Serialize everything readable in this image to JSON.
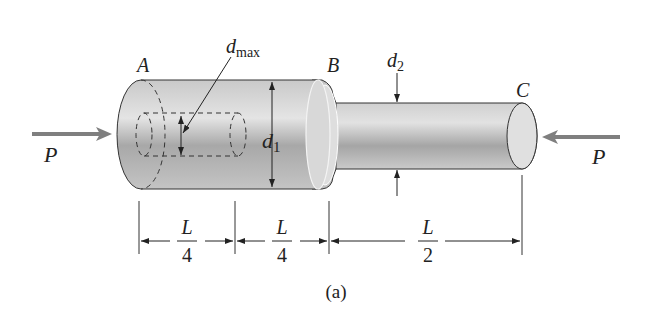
{
  "figure": {
    "caption": "(a)",
    "points": {
      "A": "A",
      "B": "B",
      "C": "C"
    },
    "load": {
      "left": "P",
      "right": "P"
    },
    "diameters": {
      "d1_main": "d",
      "d1_sub": "1",
      "d2_main": "d",
      "d2_sub": "2",
      "dmax_main": "d",
      "dmax_sub": "max"
    },
    "dimensions": [
      {
        "num": "L",
        "den": "4"
      },
      {
        "num": "L",
        "den": "4"
      },
      {
        "num": "L",
        "den": "2"
      }
    ],
    "colors": {
      "bar_light": "#e6e6e6",
      "bar_dark": "#9a9a9a",
      "arrow": "#808080",
      "line": "#222222"
    }
  }
}
